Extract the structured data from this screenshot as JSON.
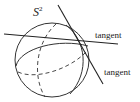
{
  "diagram": {
    "sphere_label": "S",
    "sphere_superscript": "2",
    "tangent_label_1": "tangent",
    "tangent_label_2": "tangent",
    "stroke_color": "#333333",
    "background": "#ffffff"
  }
}
